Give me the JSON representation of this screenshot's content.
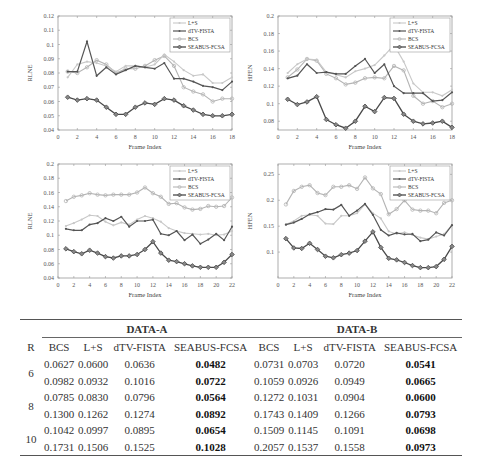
{
  "chart_data": [
    {
      "type": "line",
      "title": "",
      "xlabel": "Frame Index",
      "ylabel": "RLNE",
      "xlim": [
        0,
        18
      ],
      "ylim": [
        0.04,
        0.12
      ],
      "xticks": [
        0,
        2,
        4,
        6,
        8,
        10,
        12,
        14,
        16,
        18
      ],
      "yticks": [
        0.04,
        0.05,
        0.06,
        0.07,
        0.08,
        0.09,
        0.1,
        0.11,
        0.12
      ],
      "ytick_labels": [
        "0.04",
        "0.05",
        "0.06",
        "0.07",
        "0.08",
        "0.09",
        "0.1",
        "0.11",
        "0.12"
      ],
      "legend_position": "upper right",
      "x": [
        1,
        2,
        3,
        4,
        5,
        6,
        7,
        8,
        9,
        10,
        11,
        12,
        13,
        14,
        15,
        16,
        17,
        18
      ],
      "series": [
        {
          "name": "L+S",
          "values": [
            0.077,
            0.086,
            0.088,
            0.087,
            0.085,
            0.081,
            0.085,
            0.085,
            0.084,
            0.086,
            0.093,
            0.088,
            0.082,
            0.078,
            0.079,
            0.073,
            0.073,
            0.077
          ]
        },
        {
          "name": "dTV-FISTA",
          "values": [
            0.081,
            0.081,
            0.102,
            0.078,
            0.084,
            0.079,
            0.082,
            0.085,
            0.084,
            0.083,
            0.087,
            0.076,
            0.076,
            0.074,
            0.071,
            0.07,
            0.068,
            0.074
          ]
        },
        {
          "name": "BCS",
          "values": [
            0.081,
            0.08,
            0.084,
            0.089,
            0.086,
            0.08,
            0.083,
            0.083,
            0.085,
            0.089,
            0.092,
            0.085,
            0.07,
            0.067,
            0.065,
            0.06,
            0.062,
            0.062
          ]
        },
        {
          "name": "SEABUS-FCSA",
          "values": [
            0.063,
            0.061,
            0.062,
            0.061,
            0.056,
            0.051,
            0.051,
            0.056,
            0.059,
            0.058,
            0.062,
            0.061,
            0.057,
            0.054,
            0.051,
            0.05,
            0.05,
            0.051
          ]
        }
      ]
    },
    {
      "type": "line",
      "title": "",
      "xlabel": "Frame Index",
      "ylabel": "HFEN",
      "xlim": [
        0,
        18
      ],
      "ylim": [
        0.07,
        0.2
      ],
      "xticks": [
        0,
        2,
        4,
        6,
        8,
        10,
        12,
        14,
        16,
        18
      ],
      "yticks": [
        0.08,
        0.1,
        0.12,
        0.14,
        0.16,
        0.18,
        0.2
      ],
      "ytick_labels": [
        "0.08",
        "0.1",
        "0.12",
        "0.14",
        "0.16",
        "0.18",
        "0.2"
      ],
      "legend_position": "upper right",
      "x": [
        1,
        2,
        3,
        4,
        5,
        6,
        7,
        8,
        9,
        10,
        11,
        12,
        13,
        14,
        15,
        16,
        17,
        18
      ],
      "series": [
        {
          "name": "L+S",
          "values": [
            0.135,
            0.145,
            0.151,
            0.15,
            0.136,
            0.133,
            0.13,
            0.137,
            0.14,
            0.144,
            0.155,
            0.167,
            0.148,
            0.123,
            0.113,
            0.113,
            0.109,
            0.116
          ]
        },
        {
          "name": "dTV-FISTA",
          "values": [
            0.129,
            0.132,
            0.145,
            0.135,
            0.136,
            0.134,
            0.134,
            0.143,
            0.151,
            0.135,
            0.145,
            0.12,
            0.112,
            0.112,
            0.112,
            0.103,
            0.104,
            0.113
          ]
        },
        {
          "name": "BCS",
          "values": [
            0.13,
            0.139,
            0.151,
            0.149,
            0.134,
            0.129,
            0.122,
            0.124,
            0.129,
            0.13,
            0.129,
            0.143,
            0.138,
            0.109,
            0.1,
            0.103,
            0.096,
            0.1
          ]
        },
        {
          "name": "SEABUS-FCSA",
          "values": [
            0.105,
            0.099,
            0.102,
            0.108,
            0.082,
            0.076,
            0.072,
            0.08,
            0.097,
            0.091,
            0.107,
            0.106,
            0.088,
            0.08,
            0.077,
            0.078,
            0.08,
            0.073
          ]
        }
      ]
    },
    {
      "type": "line",
      "title": "",
      "xlabel": "Frame Index",
      "ylabel": "RLNE",
      "xlim": [
        0,
        22
      ],
      "ylim": [
        0.04,
        0.2
      ],
      "xticks": [
        0,
        2,
        4,
        6,
        8,
        10,
        12,
        14,
        16,
        18,
        20,
        22
      ],
      "yticks": [
        0.04,
        0.06,
        0.08,
        0.1,
        0.12,
        0.14,
        0.16,
        0.18,
        0.2
      ],
      "ytick_labels": [
        "0.04",
        "0.06",
        "0.08",
        "0.1",
        "0.12",
        "0.14",
        "0.16",
        "0.18",
        "0.2"
      ],
      "legend_position": "upper right",
      "x": [
        1,
        2,
        3,
        4,
        5,
        6,
        7,
        8,
        9,
        10,
        11,
        12,
        13,
        14,
        15,
        16,
        17,
        18,
        19,
        20,
        21,
        22
      ],
      "series": [
        {
          "name": "L+S",
          "values": [
            0.113,
            0.117,
            0.122,
            0.128,
            0.127,
            0.119,
            0.114,
            0.118,
            0.115,
            0.122,
            0.127,
            0.124,
            0.119,
            0.11,
            0.106,
            0.103,
            0.102,
            0.101,
            0.102,
            0.1,
            0.101,
            0.106
          ]
        },
        {
          "name": "dTV-FISTA",
          "values": [
            0.109,
            0.107,
            0.107,
            0.115,
            0.117,
            0.124,
            0.12,
            0.126,
            0.112,
            0.12,
            0.12,
            0.122,
            0.102,
            0.1,
            0.106,
            0.093,
            0.101,
            0.088,
            0.094,
            0.102,
            0.093,
            0.112
          ]
        },
        {
          "name": "BCS",
          "values": [
            0.148,
            0.154,
            0.156,
            0.159,
            0.157,
            0.156,
            0.157,
            0.157,
            0.157,
            0.16,
            0.167,
            0.159,
            0.154,
            0.144,
            0.145,
            0.139,
            0.136,
            0.137,
            0.141,
            0.14,
            0.141,
            0.153
          ]
        },
        {
          "name": "SEABUS-FCSA",
          "values": [
            0.081,
            0.077,
            0.074,
            0.079,
            0.075,
            0.07,
            0.068,
            0.071,
            0.071,
            0.073,
            0.08,
            0.091,
            0.075,
            0.065,
            0.063,
            0.06,
            0.057,
            0.055,
            0.055,
            0.055,
            0.062,
            0.073
          ]
        }
      ]
    },
    {
      "type": "line",
      "title": "",
      "xlabel": "Frame Index",
      "ylabel": "HFEN",
      "xlim": [
        0,
        22
      ],
      "ylim": [
        0.05,
        0.27
      ],
      "xticks": [
        0,
        2,
        4,
        6,
        8,
        10,
        12,
        14,
        16,
        18,
        20,
        22
      ],
      "yticks": [
        0.1,
        0.15,
        0.2,
        0.25
      ],
      "ytick_labels": [
        "0.1",
        "0.15",
        "0.2",
        "0.25"
      ],
      "legend_position": "upper right",
      "x": [
        1,
        2,
        3,
        4,
        5,
        6,
        7,
        8,
        9,
        10,
        11,
        12,
        13,
        14,
        15,
        16,
        17,
        18,
        19,
        20,
        21,
        22
      ],
      "series": [
        {
          "name": "L+S",
          "values": [
            0.153,
            0.16,
            0.17,
            0.172,
            0.17,
            0.155,
            0.154,
            0.17,
            0.17,
            0.175,
            0.192,
            0.175,
            0.165,
            0.14,
            0.135,
            0.138,
            0.133,
            0.128,
            0.125,
            0.13,
            0.135,
            0.152
          ]
        },
        {
          "name": "dTV-FISTA",
          "values": [
            0.153,
            0.157,
            0.164,
            0.173,
            0.177,
            0.183,
            0.182,
            0.191,
            0.17,
            0.18,
            0.193,
            0.172,
            0.143,
            0.132,
            0.137,
            0.134,
            0.135,
            0.121,
            0.124,
            0.138,
            0.132,
            0.152
          ]
        },
        {
          "name": "BCS",
          "values": [
            0.192,
            0.218,
            0.226,
            0.229,
            0.214,
            0.21,
            0.226,
            0.226,
            0.229,
            0.222,
            0.244,
            0.223,
            0.212,
            0.173,
            0.183,
            0.2,
            0.182,
            0.18,
            0.18,
            0.175,
            0.195,
            0.2
          ]
        },
        {
          "name": "SEABUS-FCSA",
          "values": [
            0.126,
            0.108,
            0.107,
            0.117,
            0.105,
            0.092,
            0.089,
            0.095,
            0.098,
            0.103,
            0.121,
            0.139,
            0.109,
            0.088,
            0.085,
            0.08,
            0.074,
            0.07,
            0.07,
            0.072,
            0.086,
            0.111
          ]
        }
      ]
    }
  ],
  "charts": [
    {
      "ylabel": "RLNE",
      "xlabel": "Frame Index"
    },
    {
      "ylabel": "HFEN",
      "xlabel": "Frame Index"
    },
    {
      "ylabel": "RLNE",
      "xlabel": "Frame Index"
    },
    {
      "ylabel": "HFEN",
      "xlabel": "Frame Index"
    }
  ],
  "legend": [
    "L+S",
    "dTV-FISTA",
    "BCS",
    "SEABUS-FCSA"
  ],
  "table": {
    "group_a": "DATA-A",
    "group_b": "DATA-B",
    "headers": [
      "R",
      "BCS",
      "L+S",
      "dTV-FISTA",
      "SEABUS-FCSA",
      "BCS",
      "L+S",
      "dTV-FISTA",
      "SEABUS-FCSA"
    ],
    "rows": [
      {
        "r": "6",
        "a": [
          "0.0627",
          "0.0600",
          "0.0636",
          "0.0482"
        ],
        "b": [
          "0.0731",
          "0.0703",
          "0.0720",
          "0.0541"
        ]
      },
      {
        "r": "",
        "a": [
          "0.0982",
          "0.0932",
          "0.1016",
          "0.0722"
        ],
        "b": [
          "0.1059",
          "0.0926",
          "0.0949",
          "0.0665"
        ]
      },
      {
        "r": "8",
        "a": [
          "0.0785",
          "0.0830",
          "0.0796",
          "0.0564"
        ],
        "b": [
          "0.1272",
          "0.1031",
          "0.0904",
          "0.0600"
        ]
      },
      {
        "r": "",
        "a": [
          "0.1300",
          "0.1262",
          "0.1274",
          "0.0892"
        ],
        "b": [
          "0.1743",
          "0.1409",
          "0.1266",
          "0.0793"
        ]
      },
      {
        "r": "10",
        "a": [
          "0.1042",
          "0.0997",
          "0.0895",
          "0.0654"
        ],
        "b": [
          "0.1509",
          "0.1145",
          "0.1091",
          "0.0698"
        ]
      },
      {
        "r": "",
        "a": [
          "0.1731",
          "0.1506",
          "0.1525",
          "0.1028"
        ],
        "b": [
          "0.2057",
          "0.1537",
          "0.1558",
          "0.0973"
        ]
      }
    ]
  },
  "colors": {
    "L+S": "#c8c8c8",
    "dTV-FISTA": "#555555",
    "BCS": "#b4b4b4",
    "SEABUS-FCSA": "#4a4a4a",
    "axis": "#888888"
  }
}
